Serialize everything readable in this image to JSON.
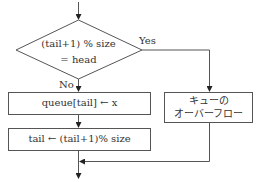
{
  "flowchart": {
    "decision": {
      "line1": "(tail+1) % size",
      "line2": "= head"
    },
    "yes_label": "Yes",
    "no_label": "No",
    "process_enqueue": "queue[tail] ← x",
    "process_advance": "tail ← (tail+1)% size",
    "overflow": {
      "line1": "キューの",
      "line2": "オーバーフロー"
    },
    "colors": {
      "stroke": "#555555",
      "text": "#333333",
      "background": "#ffffff"
    }
  }
}
